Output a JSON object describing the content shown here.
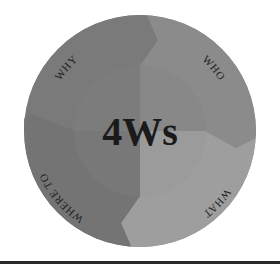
{
  "diagram": {
    "center_title": "4Ws",
    "segments": [
      {
        "label": "WHY",
        "position": "top-left",
        "color": "#7a7a7a"
      },
      {
        "label": "WHO",
        "position": "top-right",
        "color": "#8a8a8a"
      },
      {
        "label": "WHAT",
        "position": "bottom-right",
        "color": "#9e9e9e"
      },
      {
        "label": "WHERE TO",
        "position": "bottom-left",
        "color": "#737373"
      }
    ],
    "inner_circle_color": "#8c8c8c",
    "background": "#ffffff",
    "rule_color": "#2a2a2a"
  }
}
